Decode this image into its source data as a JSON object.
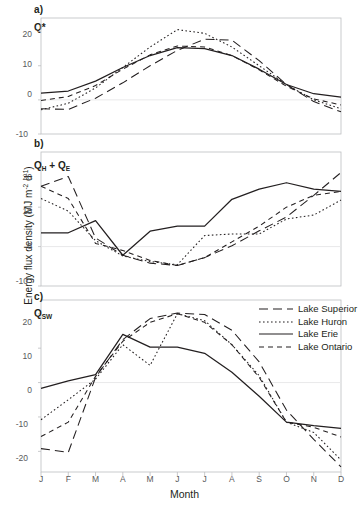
{
  "figure": {
    "xlabel": "Month",
    "ylabel_main": "Energy flux density (MJ m",
    "ylabel_sup1": "-2",
    "ylabel_mid": " d",
    "ylabel_sup2": "-1",
    "ylabel_end": ")",
    "ylabel_full": "Energy flux density (MJ m-2 d-1)",
    "months": [
      "J",
      "F",
      "M",
      "A",
      "M",
      "J",
      "J",
      "A",
      "S",
      "O",
      "N",
      "D"
    ]
  },
  "panels": [
    {
      "letter": "a)",
      "id_main": "Q",
      "id_sub": "*",
      "yticks": [
        "20",
        "10",
        "0",
        "-10"
      ]
    },
    {
      "letter": "b)",
      "id_main": "Q",
      "id_sub": "H",
      "id_extra": " + Q",
      "id_sub2": "E",
      "yticks": [
        "20",
        "10",
        "0",
        "-10"
      ]
    },
    {
      "letter": "c)",
      "id_main": "Q",
      "id_sub": "SW",
      "yticks": [
        "20",
        "10",
        "0",
        "-10",
        "-20"
      ]
    }
  ],
  "legend": {
    "position": "top-right-panel-c",
    "entries": [
      {
        "label": "Lake Superior",
        "style": "long-dash",
        "dash": "9,5"
      },
      {
        "label": "Lake Huron",
        "style": "dotted",
        "dash": "1.6,2.4"
      },
      {
        "label": "Lake Erie",
        "style": "solid",
        "dash": "none"
      },
      {
        "label": "Lake Ontario",
        "style": "dashed",
        "dash": "5,4"
      }
    ]
  },
  "colors": {
    "line": "#231f20",
    "axis": "#bcbec0",
    "zero_line": "#e6e7e8",
    "tick_text": "#58595b",
    "background": "#ffffff"
  },
  "chart_data": [
    {
      "type": "line",
      "panel": "a",
      "title": "Q*",
      "xlabel": "Month",
      "ylabel": "Energy flux density (MJ m-2 d-1)",
      "x": [
        "J",
        "F",
        "M",
        "A",
        "M",
        "J",
        "J",
        "A",
        "S",
        "O",
        "N",
        "D"
      ],
      "ylim": [
        -10,
        24
      ],
      "yticks": [
        20,
        10,
        0,
        -10
      ],
      "grid": false,
      "legend_position": "none",
      "series": [
        {
          "name": "Lake Superior",
          "values": [
            -2.6,
            -2.8,
            0.5,
            5.0,
            10.0,
            14.5,
            17.8,
            17.5,
            11.5,
            4.5,
            -0.5,
            -3.5
          ]
        },
        {
          "name": "Lake Huron",
          "values": [
            -2.9,
            -1.0,
            3.5,
            9.5,
            15.5,
            20.6,
            19.5,
            15.5,
            10.0,
            4.5,
            0.0,
            -2.6
          ]
        },
        {
          "name": "Lake Erie",
          "values": [
            2.0,
            2.6,
            5.5,
            9.5,
            13.0,
            15.3,
            15.0,
            13.0,
            9.0,
            4.5,
            1.8,
            0.8
          ]
        },
        {
          "name": "Lake Ontario",
          "values": [
            -0.2,
            1.0,
            4.2,
            9.0,
            13.2,
            15.8,
            15.5,
            13.0,
            8.8,
            4.0,
            0.3,
            -1.5
          ]
        }
      ]
    },
    {
      "type": "line",
      "panel": "b",
      "title": "QH + QE",
      "xlabel": "Month",
      "ylabel": "Energy flux density (MJ m-2 d-1)",
      "x": [
        "J",
        "F",
        "M",
        "A",
        "M",
        "J",
        "J",
        "A",
        "S",
        "O",
        "N",
        "D"
      ],
      "ylim": [
        -10,
        24
      ],
      "yticks": [
        20,
        10,
        0,
        -10
      ],
      "grid": false,
      "legend_position": "none",
      "series": [
        {
          "name": "Lake Superior",
          "values": [
            15.3,
            17.8,
            2.2,
            -2.2,
            -4.2,
            -4.8,
            -2.8,
            0.2,
            4.0,
            7.5,
            13.0,
            18.8
          ]
        },
        {
          "name": "Lake Huron",
          "values": [
            12.2,
            9.0,
            1.5,
            -2.4,
            -3.8,
            -4.6,
            2.8,
            3.2,
            3.2,
            7.0,
            8.0,
            11.8
          ]
        },
        {
          "name": "Lake Erie",
          "values": [
            3.5,
            3.5,
            6.6,
            -2.2,
            3.9,
            5.2,
            5.2,
            12.0,
            14.6,
            16.2,
            14.6,
            14.0
          ]
        },
        {
          "name": "Lake Ontario",
          "values": [
            15.3,
            12.2,
            0.8,
            -1.0,
            -3.5,
            -4.8,
            -2.8,
            1.2,
            5.2,
            10.0,
            13.0,
            14.0
          ]
        }
      ]
    },
    {
      "type": "line",
      "panel": "c",
      "title": "QSW",
      "xlabel": "Month",
      "ylabel": "Energy flux density (MJ m-2 d-1)",
      "x": [
        "J",
        "F",
        "M",
        "A",
        "M",
        "J",
        "J",
        "A",
        "S",
        "O",
        "N",
        "D"
      ],
      "ylim": [
        -26,
        24
      ],
      "yticks": [
        20,
        10,
        0,
        -10,
        -20
      ],
      "grid": false,
      "legend_position": "top-right",
      "series": [
        {
          "name": "Lake Superior",
          "values": [
            -19.2,
            -20.3,
            1.5,
            12.5,
            18.6,
            20.2,
            19.8,
            15.2,
            6.0,
            -8.0,
            -16.5,
            -24.5
          ]
        },
        {
          "name": "Lake Huron",
          "values": [
            -10.8,
            -5.0,
            1.0,
            11.0,
            5.0,
            20.0,
            18.0,
            11.0,
            2.0,
            -11.5,
            -14.5,
            -22.5
          ]
        },
        {
          "name": "Lake Erie",
          "values": [
            -1.7,
            0.5,
            2.3,
            14.0,
            10.3,
            10.3,
            8.5,
            3.0,
            -4.0,
            -11.5,
            -12.5,
            -13.3
          ]
        },
        {
          "name": "Lake Ontario",
          "values": [
            -15.7,
            -11.5,
            1.8,
            12.0,
            17.5,
            20.0,
            17.5,
            11.0,
            1.5,
            -11.5,
            -13.0,
            -15.8
          ]
        }
      ]
    }
  ]
}
